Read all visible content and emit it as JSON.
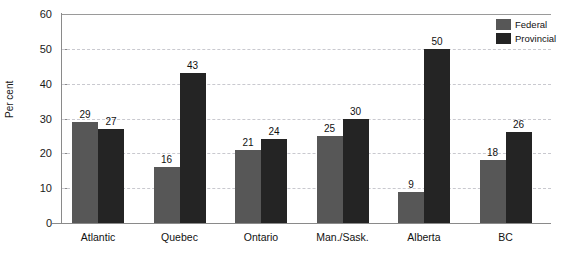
{
  "chart_data": {
    "type": "bar",
    "title": "",
    "subtitle": "",
    "xlabel": "",
    "ylabel": "Per cent",
    "ylim": [
      0,
      60
    ],
    "ytick_step": 10,
    "yticks": [
      "0",
      "10",
      "20",
      "30",
      "40",
      "50",
      "60"
    ],
    "grid": true,
    "grid_axis": "y",
    "legend_position": "top-right",
    "categories": [
      "Atlantic",
      "Quebec",
      "Ontario",
      "Man./Sask.",
      "Alberta",
      "BC"
    ],
    "series": [
      {
        "name": "Federal",
        "color": "#575757",
        "values": [
          29,
          16,
          21,
          25,
          9,
          18
        ],
        "labels": [
          "29",
          "16",
          "21",
          "25",
          "9",
          "18"
        ]
      },
      {
        "name": "Provincial",
        "color": "#242424",
        "values": [
          27,
          43,
          24,
          30,
          50,
          26
        ],
        "labels": [
          "27",
          "43",
          "24",
          "30",
          "50",
          "26"
        ]
      }
    ]
  },
  "legend": {
    "items": [
      {
        "label": "Federal",
        "color": "#575757"
      },
      {
        "label": "Provincial",
        "color": "#242424"
      }
    ]
  },
  "axis": {
    "y_title": "Per cent"
  },
  "colors": {
    "federal": "#575757",
    "provincial": "#242424",
    "gridline": "#c9c9cf",
    "axis": "#8a8a8a",
    "text": "#111111",
    "background": "#ffffff"
  }
}
